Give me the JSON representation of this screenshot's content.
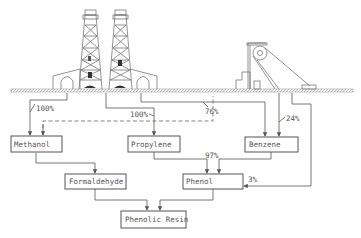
{
  "diagram": {
    "type": "flowchart",
    "illustrations": {
      "left": "oil-derricks",
      "right": "coal-mine-headframe"
    },
    "nodes": {
      "methanol": "Methanol",
      "propylene": "Propylene",
      "benzene": "Benzene",
      "formaldehyde": "Formaldehyde",
      "phenol": "Phenol",
      "phenolic_resin": "Phenolic Resin"
    },
    "labels": {
      "oil_to_methanol": "100%",
      "oil_to_propylene": "100%",
      "oil_to_benzene": "76%",
      "coal_to_benzene": "24%",
      "to_phenol": "97%",
      "coal_to_phenol": "3%"
    },
    "edges": [
      {
        "from": "oil",
        "to": "methanol",
        "label": "100%"
      },
      {
        "from": "coal",
        "to": "methanol",
        "style": "dashed"
      },
      {
        "from": "oil",
        "to": "propylene",
        "label": "100%"
      },
      {
        "from": "oil",
        "to": "benzene",
        "label": "76%"
      },
      {
        "from": "coal",
        "to": "benzene",
        "label": "24%"
      },
      {
        "from": "coal",
        "to": "phenol",
        "label": "3%"
      },
      {
        "from": "methanol",
        "to": "formaldehyde"
      },
      {
        "from": "propylene",
        "to": "phenol",
        "label": "97%"
      },
      {
        "from": "benzene",
        "to": "phenol",
        "label": "97%"
      },
      {
        "from": "formaldehyde",
        "to": "phenolic_resin"
      },
      {
        "from": "phenol",
        "to": "phenolic_resin"
      }
    ]
  }
}
